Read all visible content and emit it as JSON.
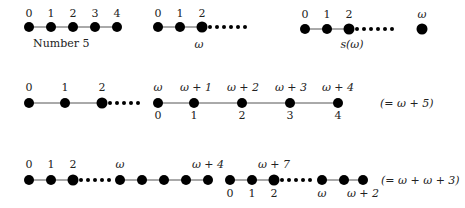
{
  "diagrams": [
    {
      "id": "row1a",
      "caption": "Number 5",
      "labels": [
        "0",
        "1",
        "2",
        "3",
        "4"
      ]
    },
    {
      "id": "row1b",
      "labels": [
        "0",
        "1",
        "2"
      ],
      "below": "ω"
    },
    {
      "id": "row1c",
      "labels": [
        "0",
        "1",
        "2"
      ],
      "below": "s(ω)",
      "isolated": "ω"
    },
    {
      "id": "row2",
      "top_labels": [
        "0",
        "1",
        "2",
        "ω",
        "ω + 1",
        "ω + 2",
        "ω + 3",
        "ω + 4"
      ],
      "bottom_labels": [
        "0",
        "1",
        "2",
        "3",
        "4"
      ],
      "equals": "(= ω + 5)"
    },
    {
      "id": "row3",
      "top_labels": [
        "0",
        "1",
        "2",
        "ω",
        "ω + 4",
        "ω + 7"
      ],
      "bottom_labels": [
        "0",
        "1",
        "2",
        "ω",
        "ω + 2"
      ],
      "equals": "(= ω + ω + 3)"
    }
  ],
  "colors": {
    "dot": "#000000",
    "line": "#555555",
    "text": "#222222"
  }
}
